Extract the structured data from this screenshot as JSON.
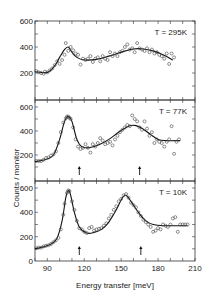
{
  "chart_data": {
    "type": "scatter",
    "title": "",
    "xlabel": "Energy transfer [meV]",
    "ylabel": "Counts / monitor",
    "xlim": [
      80,
      210
    ],
    "x_ticks": [
      90,
      120,
      150,
      180,
      210
    ],
    "layout": "three vertically stacked panels sharing x-axis",
    "panels": [
      {
        "label": "T = 295K",
        "ylim": [
          0,
          600
        ],
        "y_ticks": [
          200,
          400,
          600
        ],
        "arrows": [],
        "points": [
          [
            81,
            215
          ],
          [
            83,
            205
          ],
          [
            85,
            200
          ],
          [
            87,
            195
          ],
          [
            88,
            210
          ],
          [
            90,
            205
          ],
          [
            92,
            220
          ],
          [
            94,
            235
          ],
          [
            96,
            260
          ],
          [
            98,
            290
          ],
          [
            100,
            270
          ],
          [
            102,
            300
          ],
          [
            104,
            340
          ],
          [
            105,
            430
          ],
          [
            107,
            370
          ],
          [
            109,
            400
          ],
          [
            111,
            375
          ],
          [
            113,
            350
          ],
          [
            115,
            340
          ],
          [
            117,
            265
          ],
          [
            119,
            310
          ],
          [
            121,
            300
          ],
          [
            123,
            310
          ],
          [
            125,
            330
          ],
          [
            127,
            285
          ],
          [
            129,
            310
          ],
          [
            131,
            320
          ],
          [
            133,
            290
          ],
          [
            135,
            330
          ],
          [
            137,
            310
          ],
          [
            139,
            300
          ],
          [
            141,
            360
          ],
          [
            143,
            330
          ],
          [
            145,
            350
          ],
          [
            147,
            330
          ],
          [
            149,
            360
          ],
          [
            151,
            370
          ],
          [
            153,
            400
          ],
          [
            155,
            420
          ],
          [
            157,
            380
          ],
          [
            159,
            390
          ],
          [
            161,
            360
          ],
          [
            163,
            430
          ],
          [
            165,
            390
          ],
          [
            167,
            380
          ],
          [
            169,
            370
          ],
          [
            171,
            390
          ],
          [
            173,
            360
          ],
          [
            175,
            380
          ],
          [
            177,
            350
          ],
          [
            179,
            360
          ],
          [
            181,
            340
          ],
          [
            183,
            330
          ],
          [
            185,
            310
          ],
          [
            187,
            350
          ],
          [
            189,
            270
          ],
          [
            191,
            350
          ],
          [
            193,
            320
          ]
        ],
        "fit": [
          [
            80,
            210
          ],
          [
            90,
            205
          ],
          [
            96,
            255
          ],
          [
            100,
            320
          ],
          [
            104,
            380
          ],
          [
            107,
            400
          ],
          [
            110,
            360
          ],
          [
            114,
            320
          ],
          [
            120,
            300
          ],
          [
            130,
            305
          ],
          [
            140,
            330
          ],
          [
            150,
            360
          ],
          [
            160,
            385
          ],
          [
            168,
            385
          ],
          [
            176,
            370
          ],
          [
            184,
            340
          ],
          [
            192,
            300
          ]
        ]
      },
      {
        "label": "T = 77K",
        "ylim": [
          0,
          600
        ],
        "y_ticks": [
          200,
          400,
          600
        ],
        "arrows": [
          116,
          165
        ],
        "points": [
          [
            81,
            150
          ],
          [
            83,
            150
          ],
          [
            85,
            150
          ],
          [
            87,
            160
          ],
          [
            89,
            175
          ],
          [
            91,
            180
          ],
          [
            93,
            195
          ],
          [
            95,
            205
          ],
          [
            97,
            230
          ],
          [
            99,
            300
          ],
          [
            101,
            390
          ],
          [
            103,
            470
          ],
          [
            105,
            505
          ],
          [
            106,
            520
          ],
          [
            107,
            520
          ],
          [
            108,
            510
          ],
          [
            109,
            500
          ],
          [
            111,
            430
          ],
          [
            113,
            330
          ],
          [
            115,
            270
          ],
          [
            117,
            250
          ],
          [
            119,
            260
          ],
          [
            121,
            290
          ],
          [
            123,
            260
          ],
          [
            125,
            220
          ],
          [
            127,
            290
          ],
          [
            129,
            270
          ],
          [
            131,
            300
          ],
          [
            133,
            340
          ],
          [
            135,
            320
          ],
          [
            137,
            290
          ],
          [
            139,
            300
          ],
          [
            141,
            310
          ],
          [
            143,
            280
          ],
          [
            145,
            330
          ],
          [
            147,
            360
          ],
          [
            149,
            390
          ],
          [
            151,
            410
          ],
          [
            153,
            430
          ],
          [
            155,
            450
          ],
          [
            157,
            440
          ],
          [
            159,
            530
          ],
          [
            161,
            500
          ],
          [
            163,
            480
          ],
          [
            165,
            430
          ],
          [
            167,
            410
          ],
          [
            169,
            480
          ],
          [
            171,
            420
          ],
          [
            173,
            360
          ],
          [
            175,
            390
          ],
          [
            177,
            300
          ],
          [
            179,
            330
          ],
          [
            181,
            310
          ],
          [
            183,
            300
          ],
          [
            185,
            270
          ],
          [
            187,
            310
          ],
          [
            189,
            330
          ],
          [
            191,
            440
          ],
          [
            193,
            210
          ],
          [
            195,
            310
          ],
          [
            197,
            330
          ]
        ],
        "fit": [
          [
            80,
            145
          ],
          [
            88,
            160
          ],
          [
            95,
            200
          ],
          [
            100,
            330
          ],
          [
            104,
            480
          ],
          [
            107,
            520
          ],
          [
            110,
            480
          ],
          [
            114,
            330
          ],
          [
            118,
            270
          ],
          [
            124,
            260
          ],
          [
            132,
            285
          ],
          [
            140,
            330
          ],
          [
            148,
            390
          ],
          [
            156,
            440
          ],
          [
            162,
            445
          ],
          [
            168,
            415
          ],
          [
            174,
            370
          ],
          [
            180,
            330
          ],
          [
            186,
            320
          ],
          [
            198,
            320
          ]
        ]
      },
      {
        "label": "T = 10K",
        "ylim": [
          0,
          600
        ],
        "y_ticks": [
          0,
          200,
          400,
          600
        ],
        "arrows": [
          116,
          166
        ],
        "points": [
          [
            81,
            105
          ],
          [
            83,
            110
          ],
          [
            85,
            110
          ],
          [
            87,
            120
          ],
          [
            89,
            125
          ],
          [
            91,
            130
          ],
          [
            93,
            140
          ],
          [
            95,
            155
          ],
          [
            97,
            170
          ],
          [
            99,
            190
          ],
          [
            101,
            260
          ],
          [
            103,
            380
          ],
          [
            104,
            470
          ],
          [
            106,
            560
          ],
          [
            107,
            580
          ],
          [
            108,
            575
          ],
          [
            110,
            490
          ],
          [
            112,
            420
          ],
          [
            114,
            330
          ],
          [
            116,
            270
          ],
          [
            118,
            260
          ],
          [
            120,
            240
          ],
          [
            122,
            230
          ],
          [
            124,
            270
          ],
          [
            126,
            280
          ],
          [
            128,
            250
          ],
          [
            130,
            260
          ],
          [
            132,
            265
          ],
          [
            134,
            270
          ],
          [
            136,
            290
          ],
          [
            138,
            310
          ],
          [
            140,
            350
          ],
          [
            142,
            380
          ],
          [
            144,
            420
          ],
          [
            146,
            450
          ],
          [
            148,
            490
          ],
          [
            150,
            510
          ],
          [
            152,
            540
          ],
          [
            154,
            550
          ],
          [
            156,
            520
          ],
          [
            158,
            480
          ],
          [
            160,
            460
          ],
          [
            162,
            440
          ],
          [
            164,
            400
          ],
          [
            166,
            370
          ],
          [
            168,
            340
          ],
          [
            170,
            320
          ],
          [
            172,
            300
          ],
          [
            174,
            280
          ],
          [
            176,
            240
          ],
          [
            178,
            250
          ],
          [
            180,
            270
          ],
          [
            182,
            260
          ],
          [
            184,
            300
          ],
          [
            186,
            290
          ],
          [
            188,
            280
          ],
          [
            190,
            300
          ],
          [
            192,
            350
          ],
          [
            194,
            360
          ],
          [
            196,
            240
          ],
          [
            198,
            300
          ],
          [
            200,
            300
          ],
          [
            202,
            300
          ],
          [
            204,
            300
          ]
        ],
        "fit": [
          [
            80,
            100
          ],
          [
            88,
            120
          ],
          [
            94,
            145
          ],
          [
            98,
            190
          ],
          [
            102,
            330
          ],
          [
            105,
            520
          ],
          [
            107,
            580
          ],
          [
            109,
            540
          ],
          [
            112,
            400
          ],
          [
            116,
            280
          ],
          [
            122,
            230
          ],
          [
            128,
            235
          ],
          [
            134,
            260
          ],
          [
            140,
            320
          ],
          [
            146,
            420
          ],
          [
            151,
            520
          ],
          [
            154,
            540
          ],
          [
            158,
            490
          ],
          [
            164,
            400
          ],
          [
            170,
            330
          ],
          [
            176,
            300
          ],
          [
            184,
            290
          ],
          [
            204,
            290
          ]
        ]
      }
    ]
  }
}
